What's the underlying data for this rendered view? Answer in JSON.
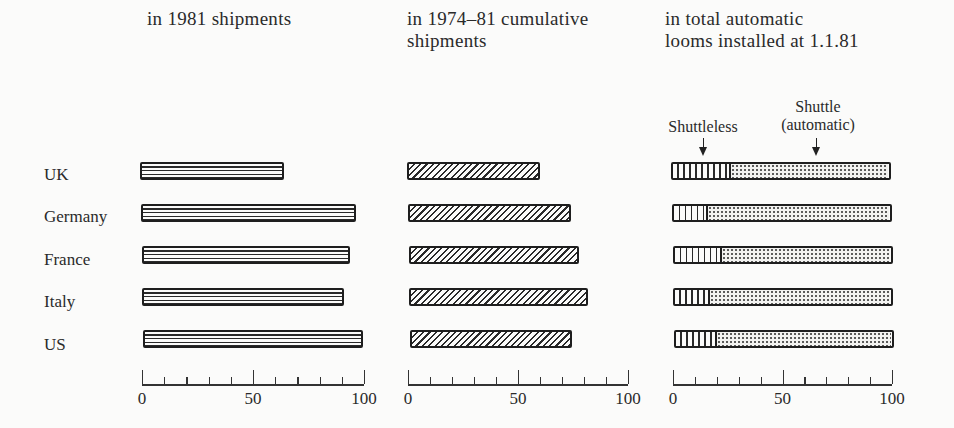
{
  "titles": {
    "panel1": "in 1981 shipments",
    "panel2": "in 1974–81 cumulative\nshipments",
    "panel3": "in total automatic\nlooms installed at 1.1.81"
  },
  "legend": {
    "shuttleless": "Shuttleless",
    "shuttle": "Shuttle\n(automatic)"
  },
  "countries": [
    "UK",
    "Germany",
    "France",
    "Italy",
    "US"
  ],
  "axis_ticks": [
    "0",
    "50",
    "100"
  ],
  "chart_data": [
    {
      "type": "bar",
      "orientation": "horizontal",
      "title": "in 1981 shipments",
      "categories": [
        "UK",
        "Germany",
        "France",
        "Italy",
        "US"
      ],
      "values": [
        65,
        97,
        94,
        91,
        99
      ],
      "xlabel": "",
      "ylabel": "",
      "xlim": [
        0,
        100
      ],
      "xticks": [
        0,
        50,
        100
      ],
      "minor_tick_step": 10,
      "pattern": "horizontal-lines",
      "grid": false
    },
    {
      "type": "bar",
      "orientation": "horizontal",
      "title": "in 1974–81 cumulative shipments",
      "categories": [
        "UK",
        "Germany",
        "France",
        "Italy",
        "US"
      ],
      "values": [
        60,
        74,
        77,
        81,
        73
      ],
      "xlabel": "",
      "ylabel": "",
      "xlim": [
        0,
        100
      ],
      "xticks": [
        0,
        50,
        100
      ],
      "minor_tick_step": 10,
      "pattern": "diagonal-hatch",
      "grid": false
    },
    {
      "type": "bar",
      "orientation": "horizontal",
      "stacked": true,
      "title": "in total automatic looms installed at 1.1.81",
      "categories": [
        "UK",
        "Germany",
        "France",
        "Italy",
        "US"
      ],
      "series": [
        {
          "name": "Shuttleless",
          "values": [
            27,
            16,
            22,
            16,
            19
          ],
          "pattern": "vertical-lines"
        },
        {
          "name": "Shuttle (automatic)",
          "values": [
            73,
            84,
            78,
            84,
            81
          ],
          "pattern": "dotted"
        }
      ],
      "xlabel": "",
      "ylabel": "",
      "xlim": [
        0,
        100
      ],
      "xticks": [
        0,
        50,
        100
      ],
      "minor_tick_step": 10,
      "legend_position": "top, with arrows pointing to UK bar",
      "grid": false
    }
  ]
}
